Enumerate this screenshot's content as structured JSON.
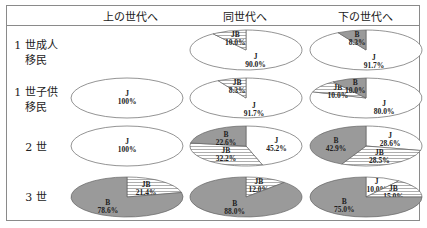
{
  "header": {
    "columns": [
      "上の世代へ",
      "同世代へ",
      "下の世代へ"
    ]
  },
  "rows": [
    {
      "label_line1": "1 世成人",
      "label_line2": "移民"
    },
    {
      "label_line1": "1 世子供",
      "label_line2": "移民"
    },
    {
      "label_line1": "2 世",
      "label_line2": ""
    },
    {
      "label_line1": "3 世",
      "label_line2": ""
    }
  ],
  "colors": {
    "J": "#ffffff",
    "JB": "#f4f4f4",
    "B": "#9a9a9a",
    "stroke": "#666666",
    "border": "#8a8a8a"
  },
  "chart_data": {
    "type": "pie",
    "title": "",
    "categories": [
      "J",
      "JB",
      "B"
    ],
    "column_headers": [
      "上の世代へ",
      "同世代へ",
      "下の世代へ"
    ],
    "row_headers": [
      "1 世成人移民",
      "1 世子供移民",
      "2 世",
      "3 世"
    ],
    "charts": [
      {
        "row": "1 世成人移民",
        "column": "同世代へ",
        "slices": [
          {
            "label": "J",
            "value": 90.0,
            "text": "90.0%"
          },
          {
            "label": "JB",
            "value": 10.0,
            "text": "10.0%"
          }
        ]
      },
      {
        "row": "1 世成人移民",
        "column": "下の世代へ",
        "slices": [
          {
            "label": "J",
            "value": 91.7,
            "text": "91.7%"
          },
          {
            "label": "B",
            "value": 8.3,
            "text": "8.3%"
          }
        ]
      },
      {
        "row": "1 世子供移民",
        "column": "上の世代へ",
        "slices": [
          {
            "label": "J",
            "value": 100,
            "text": "100%"
          }
        ]
      },
      {
        "row": "1 世子供移民",
        "column": "同世代へ",
        "slices": [
          {
            "label": "J",
            "value": 91.7,
            "text": "91.7%"
          },
          {
            "label": "JB",
            "value": 8.3,
            "text": "8.3%"
          }
        ]
      },
      {
        "row": "1 世子供移民",
        "column": "下の世代へ",
        "slices": [
          {
            "label": "J",
            "value": 80.0,
            "text": "80.0%"
          },
          {
            "label": "JB",
            "value": 10.0,
            "text": "10.0%"
          },
          {
            "label": "B",
            "value": 10.0,
            "text": "10.0%"
          }
        ]
      },
      {
        "row": "2 世",
        "column": "上の世代へ",
        "slices": [
          {
            "label": "J",
            "value": 100,
            "text": "100%"
          }
        ]
      },
      {
        "row": "2 世",
        "column": "同世代へ",
        "slices": [
          {
            "label": "J",
            "value": 45.2,
            "text": "45.2%"
          },
          {
            "label": "JB",
            "value": 32.2,
            "text": "32.2%"
          },
          {
            "label": "B",
            "value": 22.6,
            "text": "22.6%"
          }
        ]
      },
      {
        "row": "2 世",
        "column": "下の世代へ",
        "slices": [
          {
            "label": "J",
            "value": 28.6,
            "text": "28.6%"
          },
          {
            "label": "JB",
            "value": 28.5,
            "text": "28.5%"
          },
          {
            "label": "B",
            "value": 42.9,
            "text": "42.9%"
          }
        ]
      },
      {
        "row": "3 世",
        "column": "上の世代へ",
        "slices": [
          {
            "label": "JB",
            "value": 21.4,
            "text": "21.4%"
          },
          {
            "label": "B",
            "value": 78.6,
            "text": "78.6%"
          }
        ]
      },
      {
        "row": "3 世",
        "column": "同世代へ",
        "slices": [
          {
            "label": "JB",
            "value": 12.0,
            "text": "12.0%"
          },
          {
            "label": "B",
            "value": 88.0,
            "text": "88.0%"
          }
        ]
      },
      {
        "row": "3 世",
        "column": "下の世代へ",
        "slices": [
          {
            "label": "J",
            "value": 10.0,
            "text": "10.0%"
          },
          {
            "label": "JB",
            "value": 15.0,
            "text": "15.0%"
          },
          {
            "label": "B",
            "value": 75.0,
            "text": "75.0%"
          }
        ]
      }
    ],
    "legend": "none",
    "grid": false
  }
}
